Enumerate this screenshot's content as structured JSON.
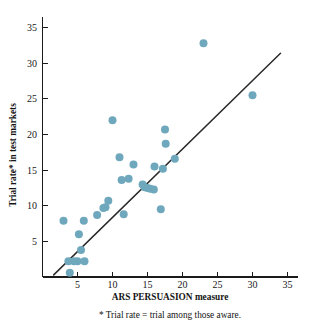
{
  "chart_data": {
    "type": "scatter",
    "title": "",
    "xlabel": "ARS PERSUASION measure",
    "ylabel": "Trial rate* in test markets",
    "footnote": "* Trial rate = trial among those aware.",
    "xlim": [
      0,
      36.5
    ],
    "ylim": [
      0,
      36.5
    ],
    "grid": false,
    "legend": null,
    "xticks": [
      5,
      10,
      15,
      20,
      25,
      30,
      35
    ],
    "yticks": [
      5,
      10,
      15,
      20,
      25,
      30,
      35
    ],
    "xtick_labels": [
      "5",
      "10",
      "15",
      "20",
      "25",
      "30",
      "35"
    ],
    "ytick_labels": [
      "5",
      "10",
      "15",
      "20",
      "25",
      "30",
      "35"
    ],
    "marker_color": "#6fa8bd",
    "marker_size": 4.0,
    "line_color": "#2a2a2a",
    "points": [
      {
        "x": 3.0,
        "y": 7.9
      },
      {
        "x": 3.7,
        "y": 2.2
      },
      {
        "x": 3.9,
        "y": 0.6
      },
      {
        "x": 4.5,
        "y": 2.2
      },
      {
        "x": 5.0,
        "y": 2.2
      },
      {
        "x": 5.2,
        "y": 6.0
      },
      {
        "x": 5.5,
        "y": 3.8
      },
      {
        "x": 5.9,
        "y": 7.9
      },
      {
        "x": 6.0,
        "y": 2.2
      },
      {
        "x": 7.8,
        "y": 8.7
      },
      {
        "x": 8.7,
        "y": 9.7
      },
      {
        "x": 9.0,
        "y": 9.8
      },
      {
        "x": 9.4,
        "y": 10.7
      },
      {
        "x": 10.0,
        "y": 22.0
      },
      {
        "x": 11.0,
        "y": 16.8
      },
      {
        "x": 11.3,
        "y": 13.6
      },
      {
        "x": 11.6,
        "y": 8.8
      },
      {
        "x": 12.3,
        "y": 13.8
      },
      {
        "x": 13.0,
        "y": 15.8
      },
      {
        "x": 14.3,
        "y": 13.0
      },
      {
        "x": 14.6,
        "y": 12.6
      },
      {
        "x": 15.0,
        "y": 12.5
      },
      {
        "x": 15.4,
        "y": 12.4
      },
      {
        "x": 15.9,
        "y": 12.3
      },
      {
        "x": 16.0,
        "y": 15.5
      },
      {
        "x": 16.9,
        "y": 9.5
      },
      {
        "x": 17.2,
        "y": 15.2
      },
      {
        "x": 17.5,
        "y": 20.7
      },
      {
        "x": 17.6,
        "y": 18.7
      },
      {
        "x": 18.9,
        "y": 16.6
      },
      {
        "x": 23.0,
        "y": 32.8
      },
      {
        "x": 30.0,
        "y": 25.5
      }
    ],
    "fit_line": {
      "x0": 1.6,
      "y0": 0.3,
      "x1": 34.0,
      "y1": 31.4
    }
  }
}
